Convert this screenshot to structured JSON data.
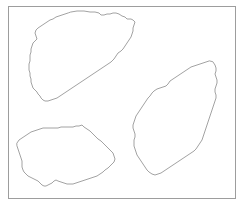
{
  "figure": {
    "title": "",
    "type": "region-outline-diagram",
    "background_color": "#ffffff",
    "canvas": {
      "width": 244,
      "height": 208
    },
    "frame": {
      "name": "plot-border",
      "x": 8.5,
      "y": 6.5,
      "width": 227,
      "height": 192,
      "stroke_color": "#9d9d9d",
      "stroke_width": 1,
      "fill": "none"
    },
    "shape_style": {
      "stroke_color": "#8a8a8a",
      "stroke_width": 0.8,
      "fill_color": "#ffffff"
    },
    "regions": [
      {
        "id": "region-1",
        "label": "upper-left-region",
        "points": "71,12 77,11 84,11 90,12 95,12 99,13 101,15 104,15 107,14 110,14 113,13 116,13 119,14 122,16 125,17 127,19 131,19 133,20 135,22 134,25 133,28 133,31 132,34 131,37 129,40 127,43 125,46 123,49 121,51 118,53 116,56 114,59 111,62 108,64 105,66 102,68 99,70 96,72 93,74 90,76 87,78 84,80 81,82 78,84 75,86 72,88 69,90 66,92 63,94 60,96 57,98 54,99 51,100 48,101 45,101 43,100 41,98 40,96 38,94 37,92 35,90 33,88 32,85 31,82 31,79 30,76 30,73 29,70 29,67 29,64 30,61 30,58 30,55 31,52 31,49 32,46 33,43 35,41 37,39 36,36 35,33 36,30 38,28 41,26 44,24 47,22 50,20 53,19 56,17 59,16 62,15 65,14 68,13"
      },
      {
        "id": "region-2",
        "label": "right-region",
        "points": "213,62 215,65 216,68 216,71 215,74 216,77 217,80 217,83 216,86 215,89 215,92 216,95 216,98 215,101 214,104 213,107 212,110 211,113 210,116 209,119 208,122 207,125 206,128 205,131 204,134 203,137 202,140 200,143 198,146 196,149 194,151 191,153 188,155 185,157 182,159 179,161 176,163 173,165 170,167 167,169 164,171 161,173 158,174 155,175 152,174 149,172 147,170 145,167 143,164 141,161 139,158 137,155 136,152 135,149 134,146 134,143 134,140 135,137 135,134 134,131 133,128 133,125 134,122 135,119 136,116 138,113 140,110 142,107 144,104 146,101 148,98 150,96 152,93 154,91 157,89 160,88 163,87 166,86 168,84 170,81 173,79 176,77 179,75 182,73 185,71 188,69 191,67 194,66 197,65 200,64 203,63 206,62 209,61"
      },
      {
        "id": "region-3",
        "label": "lower-left-region",
        "points": "17,143 19,140 22,138 25,136 28,134 31,132 34,131 37,130 40,129 43,128 46,128 49,128 52,128 55,128 58,128 61,127 64,127 67,127 70,127 73,127 76,126 79,126 82,125 84,127 87,129 90,131 92,133 94,135 96,137 98,139 101,141 103,143 105,145 107,147 109,149 111,151 113,153 114,156 115,159 114,162 112,164 110,166 108,168 105,170 103,172 100,174 97,176 94,177 91,178 88,179 85,180 82,181 79,182 76,183 73,184 70,184 67,184 64,183 61,182 58,181 56,180 54,181 52,183 50,184 48,185 46,186 44,186 42,185 40,183 38,181 36,180 34,179 32,178 30,177 28,176 26,174 24,172 23,170 22,167 22,164 22,161 21,158 20,155 19,152 18,149 17,146"
      }
    ]
  }
}
